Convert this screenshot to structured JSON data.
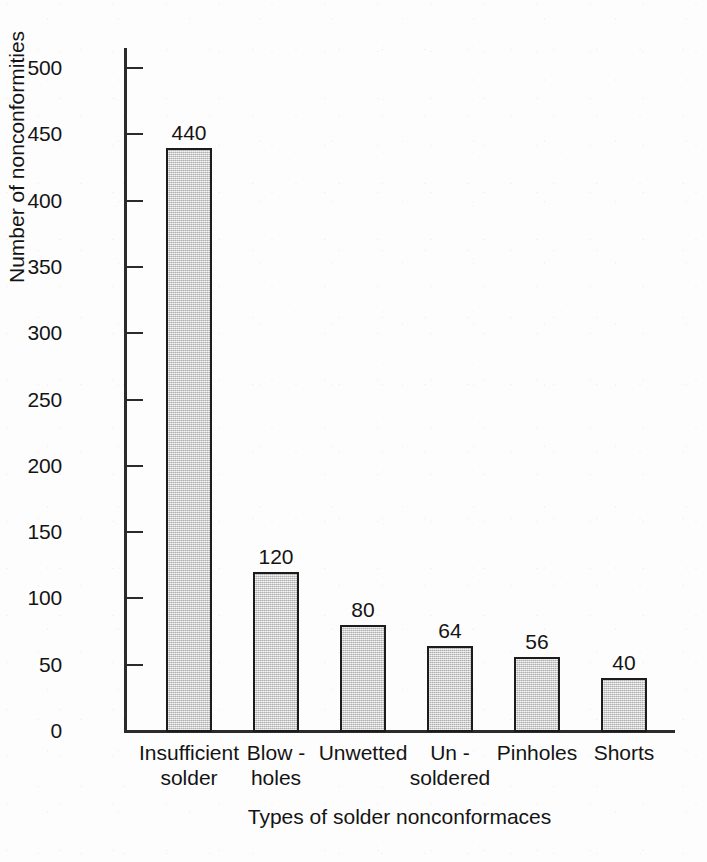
{
  "chart_data": {
    "type": "bar",
    "title": "",
    "subtitle": "",
    "xlabel": "Types of solder nonconformaces",
    "ylabel": "Number of nonconformities",
    "categories": [
      "Insufficient\nsolder",
      "Blow -\nholes",
      "Unwetted",
      "Un -\nsoldered",
      "Pinholes",
      "Shorts"
    ],
    "values": [
      440,
      120,
      80,
      64,
      56,
      40
    ],
    "data_labels": [
      "440",
      "120",
      "80",
      "64",
      "56",
      "40"
    ],
    "ylim": [
      0,
      500
    ],
    "ytick_values": [
      0,
      50,
      100,
      150,
      200,
      250,
      300,
      350,
      400,
      450,
      500
    ],
    "ytick_labels": [
      "0",
      "50",
      "100",
      "150",
      "200",
      "250",
      "300",
      "350",
      "400",
      "450",
      "500"
    ],
    "ytick_interval": 50,
    "grid": false,
    "legend": null,
    "legend_position": "none",
    "bar_fill_color": "#c9c9c9",
    "bar_edge_color": "#1c1c1c",
    "axis_color": "#2b2b2b",
    "background_color": "#fdfdfd",
    "text_color": "#141414"
  }
}
